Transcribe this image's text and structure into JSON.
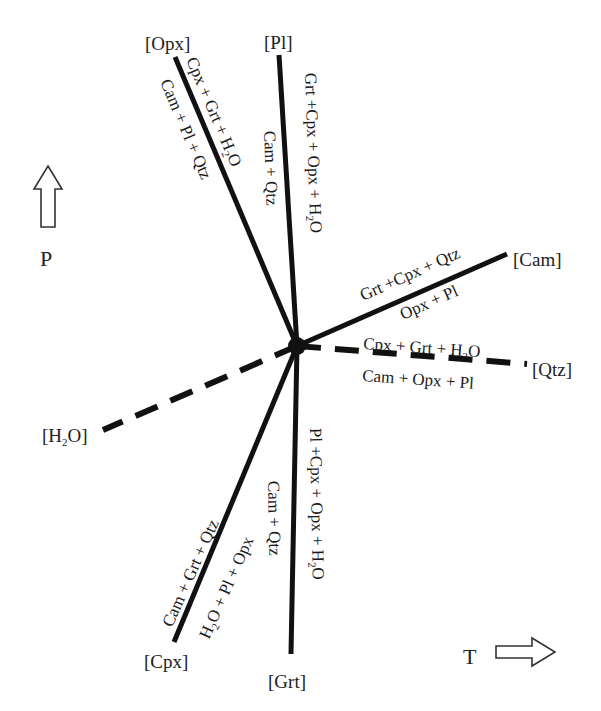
{
  "diagram": {
    "type": "petrogenetic-grid-invariant-point",
    "invariant_point": {
      "x": 297,
      "y": 346
    },
    "axes": {
      "pressure": {
        "label": "P",
        "arrow": "up"
      },
      "temperature": {
        "label": "T",
        "arrow": "right"
      }
    },
    "reactions": [
      {
        "id": "opx",
        "absent_phase": "[Opx]",
        "style": "solid",
        "side_a": "Cpx + Grt + H2O",
        "side_b": "Cam + Pl + Qtz"
      },
      {
        "id": "pl",
        "absent_phase": "[Pl]",
        "style": "solid",
        "side_a": "Grt +Cpx + Opx + H2O",
        "side_b": "Cam + Qtz"
      },
      {
        "id": "cam",
        "absent_phase": "[Cam]",
        "style": "solid",
        "side_a": "Grt +Cpx + Qtz",
        "side_b": "Opx + Pl"
      },
      {
        "id": "qtz",
        "absent_phase": "[Qtz]",
        "style": "dashed",
        "side_a": "Cpx + Grt + H2O",
        "side_b": "Cam + Opx + Pl"
      },
      {
        "id": "h2o",
        "absent_phase": "[H2O]",
        "style": "dashed",
        "side_a": "",
        "side_b": ""
      },
      {
        "id": "cpx",
        "absent_phase": "[Cpx]",
        "style": "solid",
        "side_a": "Cam + Grt + Qtz",
        "side_b": "H2O + Pl + Opx"
      },
      {
        "id": "grt",
        "absent_phase": "[Grt]",
        "style": "solid",
        "side_a": "Pl +Cpx + Opx + H2O",
        "side_b": "Cam + Qtz"
      }
    ]
  },
  "labels": {
    "opx": "[Opx]",
    "pl": "[Pl]",
    "cam": "[Cam]",
    "qtz": "[Qtz]",
    "h2o_pre": "[H",
    "h2o_sub": "2",
    "h2o_post": "O]",
    "cpx": "[Cpx]",
    "grt": "[Grt]",
    "P": "P",
    "T": "T"
  },
  "rxn": {
    "opx_a_pre": "Cpx + Grt + H",
    "opx_a_sub": "2",
    "opx_a_post": "O",
    "opx_b": "Cam + Pl + Qtz",
    "pl_a_pre": "Grt +Cpx + Opx + H",
    "pl_a_sub": "2",
    "pl_a_post": "O",
    "pl_b": "Cam + Qtz",
    "cam_a": "Grt +Cpx + Qtz",
    "cam_b": "Opx + Pl",
    "qtz_a_pre": "Cpx + Grt + H",
    "qtz_a_sub": "2",
    "qtz_a_post": "O",
    "qtz_b": "Cam + Opx + Pl",
    "cpx_a": "Cam + Grt + Qtz",
    "cpx_b_pre": "H",
    "cpx_b_sub": "2",
    "cpx_b_post": "O + Pl + Opx",
    "grt_a_pre": "Pl +Cpx + Opx + H",
    "grt_a_sub": "2",
    "grt_a_post": "O",
    "grt_b": "Cam + Qtz"
  }
}
